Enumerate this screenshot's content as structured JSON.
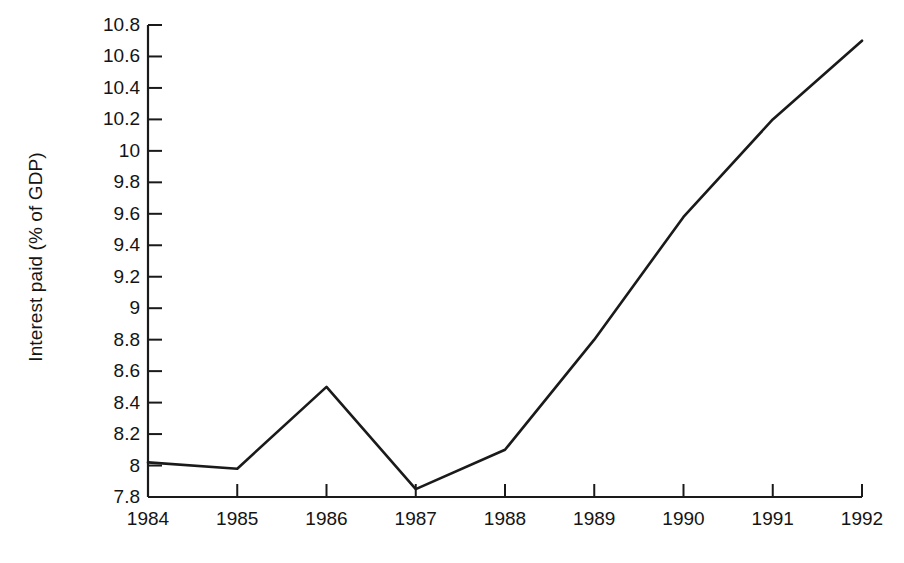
{
  "chart_data": {
    "type": "line",
    "title": "",
    "subtitle": "",
    "xlabel": "",
    "ylabel": "Interest paid (% of GDP)",
    "categories": [
      "1984",
      "1985",
      "1986",
      "1987",
      "1988",
      "1989",
      "1990",
      "1991",
      "1992"
    ],
    "x": [
      1984,
      1985,
      1986,
      1987,
      1988,
      1989,
      1990,
      1991,
      1992
    ],
    "values": [
      8.02,
      7.98,
      8.5,
      7.85,
      8.1,
      8.8,
      9.58,
      10.2,
      10.7
    ],
    "series": [
      {
        "name": "Interest paid (% of GDP)",
        "values": [
          8.02,
          7.98,
          8.5,
          7.85,
          8.1,
          8.8,
          9.58,
          10.2,
          10.7
        ]
      }
    ],
    "ylim": [
      7.8,
      10.8
    ],
    "xlim": [
      1984,
      1992
    ],
    "ytick_labels": [
      "10.8",
      "10.6",
      "10.4",
      "10.2",
      "10",
      "9.8",
      "9.6",
      "9.4",
      "9.2",
      "9",
      "8.8",
      "8.6",
      "8.4",
      "8.2",
      "8",
      "7.8"
    ],
    "ytick_values": [
      10.8,
      10.6,
      10.4,
      10.2,
      10.0,
      9.8,
      9.6,
      9.4,
      9.2,
      9.0,
      8.8,
      8.6,
      8.4,
      8.2,
      8.0,
      7.8
    ],
    "xtick_labels": [
      "1984",
      "1985",
      "1986",
      "1987",
      "1988",
      "1989",
      "1990",
      "1991",
      "1992"
    ],
    "grid": false,
    "legend": false,
    "legend_position": "none",
    "annotations": [],
    "line_color": "#1a1a1a",
    "axis_color": "#1a1a1a",
    "background_color": "#ffffff"
  },
  "axes": {
    "y_title": "Interest paid (% of GDP)"
  }
}
